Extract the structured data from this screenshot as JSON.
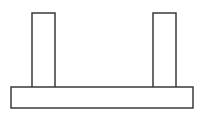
{
  "canvas": {
    "width": 204,
    "height": 114,
    "background_color": "#ffffff",
    "title": "Line drawing of a table-like / H-beam cross-section figure"
  },
  "style": {
    "stroke_color": "#3a3a3a",
    "stroke_width": 1.5,
    "fill_color": "none",
    "line_cap": "butt",
    "line_join": "miter"
  },
  "shapes": {
    "base": {
      "label": "base slab",
      "type": "rectangle",
      "x": 11,
      "y": 87,
      "width": 182,
      "height": 21,
      "fill": "none"
    },
    "left_post": {
      "label": "left vertical post",
      "type": "open-bottom-rectangle",
      "x": 32,
      "y": 13,
      "width": 23,
      "height": 74,
      "fill": "none",
      "path": "M 32 87 L 32 13 L 55 13 L 55 87"
    },
    "right_post": {
      "label": "right vertical post",
      "type": "open-bottom-rectangle",
      "x": 153,
      "y": 13,
      "width": 23,
      "height": 74,
      "fill": "none",
      "path": "M 153 87 L 153 13 L 176 13 L 176 87"
    }
  }
}
